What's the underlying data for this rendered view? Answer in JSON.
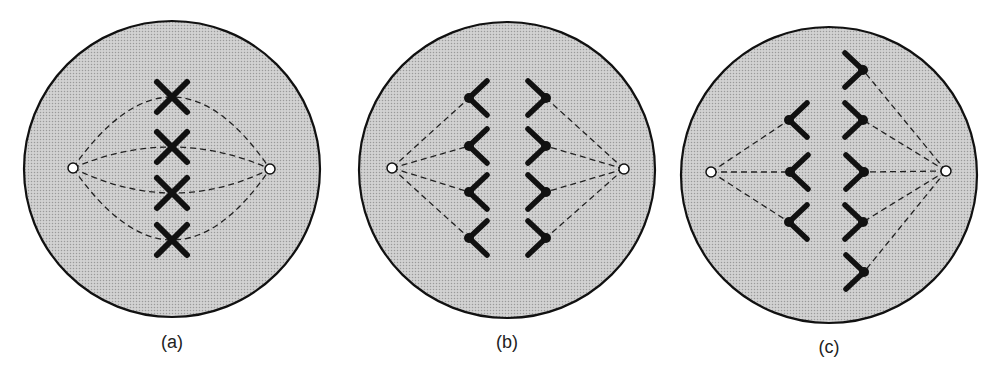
{
  "figure": {
    "title": "",
    "colors": {
      "cell_fill": "#c9c9c9",
      "cell_outline": "#111111",
      "chromosome": "#111111",
      "spindle": "#222222",
      "pole_fill": "#ffffff",
      "background": "#ffffff"
    },
    "panels": [
      {
        "id": "a",
        "label": "(a)",
        "stage_description": "chromosomes aligned at equator, spindle fibres pole to pole",
        "cell": {
          "cx": 172,
          "cy": 169,
          "r": 148
        },
        "poles": [
          {
            "x": 73,
            "y": 168
          },
          {
            "x": 270,
            "y": 169
          }
        ],
        "label_pos": {
          "x": 172,
          "y": 332
        },
        "chromosomes_x": [
          {
            "x": 172,
            "y": 97
          },
          {
            "x": 172,
            "y": 147
          },
          {
            "x": 172,
            "y": 193
          },
          {
            "x": 172,
            "y": 240
          }
        ]
      },
      {
        "id": "b",
        "label": "(b)",
        "stage_description": "sister chromatids separating toward poles, 4 per side",
        "cell": {
          "cx": 507,
          "cy": 170,
          "r": 148
        },
        "poles": [
          {
            "x": 392,
            "y": 168
          },
          {
            "x": 624,
            "y": 169
          }
        ],
        "label_pos": {
          "x": 507,
          "y": 332
        },
        "chromatids_left": [
          {
            "x": 469,
            "y": 98
          },
          {
            "x": 469,
            "y": 146
          },
          {
            "x": 469,
            "y": 192
          },
          {
            "x": 469,
            "y": 238
          }
        ],
        "chromatids_right": [
          {
            "x": 546,
            "y": 98
          },
          {
            "x": 546,
            "y": 146
          },
          {
            "x": 546,
            "y": 192
          },
          {
            "x": 546,
            "y": 238
          }
        ]
      },
      {
        "id": "c",
        "label": "(c)",
        "stage_description": "unequal segregation: 3 chromatids left, 5 right",
        "cell": {
          "cx": 829,
          "cy": 175,
          "r": 148
        },
        "poles": [
          {
            "x": 711,
            "y": 172
          },
          {
            "x": 946,
            "y": 171
          }
        ],
        "label_pos": {
          "x": 829,
          "y": 337
        },
        "chromatids_left": [
          {
            "x": 789,
            "y": 120
          },
          {
            "x": 790,
            "y": 172
          },
          {
            "x": 789,
            "y": 222
          }
        ],
        "chromatids_right": [
          {
            "x": 863,
            "y": 70
          },
          {
            "x": 863,
            "y": 120
          },
          {
            "x": 864,
            "y": 172
          },
          {
            "x": 863,
            "y": 222
          },
          {
            "x": 864,
            "y": 272
          }
        ]
      }
    ]
  }
}
